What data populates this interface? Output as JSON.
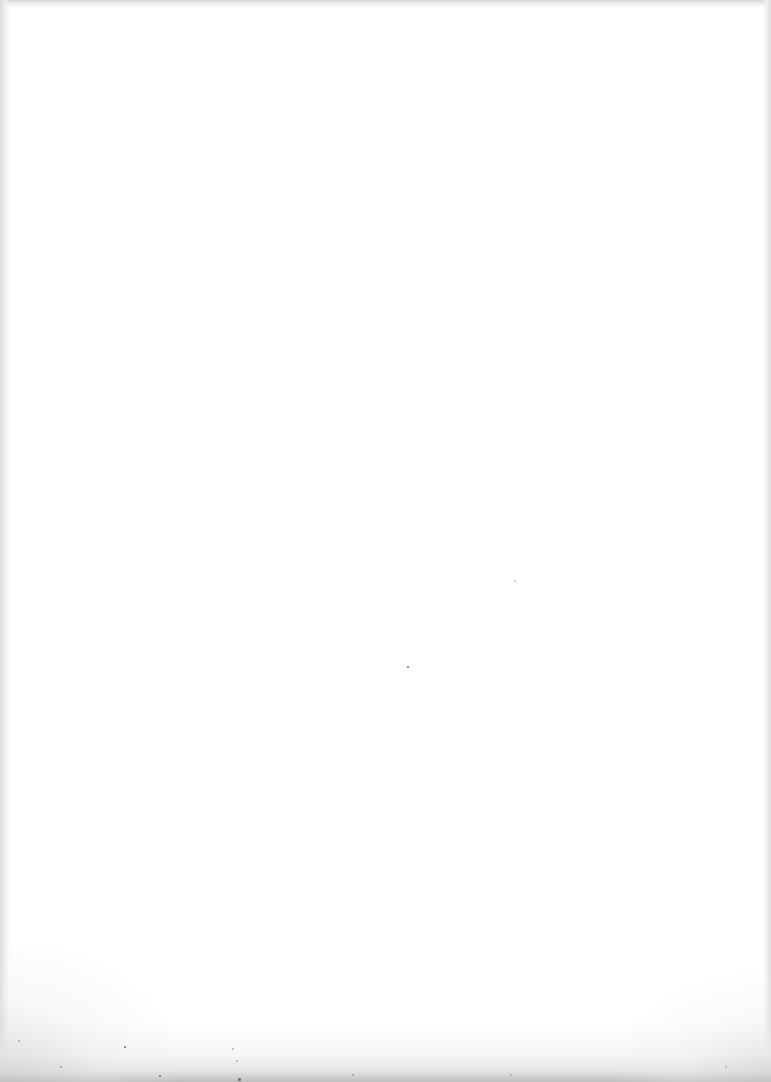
{
  "document": {
    "type": "scanned-page",
    "content": "",
    "text_blocks": []
  }
}
